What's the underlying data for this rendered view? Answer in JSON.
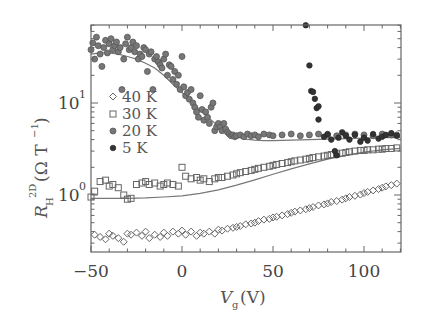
{
  "chart_data": {
    "type": "scatter",
    "title": "",
    "xlabel": "V_g (V)",
    "ylabel": "R_H^2D (Ω T^-1)",
    "xlim": [
      -50,
      120
    ],
    "ylim": [
      0.24,
      70
    ],
    "yscale": "log",
    "grid": false,
    "legend_position": "upper-left inside",
    "x_ticks": [
      -50,
      0,
      50,
      100
    ],
    "x_tick_labels": [
      "−50",
      "0",
      "50",
      "100"
    ],
    "y_ticks": [
      1,
      10
    ],
    "y_tick_labels": [
      "10⁰",
      "10¹"
    ],
    "legend": [
      "40 K",
      "30 K",
      "20 K",
      "5 K"
    ],
    "series": [
      {
        "name": "40 K",
        "marker": "diamond-open",
        "x": [
          -48,
          -45,
          -42,
          -40,
          -38,
          -35,
          -32,
          -30,
          -28,
          -25,
          -22,
          -20,
          -18,
          -15,
          -12,
          -10,
          -8,
          -5,
          -2,
          0,
          2,
          5,
          8,
          10,
          12,
          15,
          18,
          20,
          22,
          25,
          28,
          30,
          32,
          35,
          38,
          40,
          42,
          45,
          48,
          50,
          52,
          55,
          58,
          60,
          62,
          65,
          68,
          70,
          72,
          75,
          78,
          80,
          82,
          85,
          88,
          90,
          92,
          95,
          98,
          100,
          102,
          105,
          108,
          110,
          112,
          115,
          118
        ],
        "y": [
          0.37,
          0.35,
          0.33,
          0.38,
          0.36,
          0.34,
          0.31,
          0.38,
          0.37,
          0.39,
          0.36,
          0.4,
          0.34,
          0.37,
          0.35,
          0.39,
          0.36,
          0.4,
          0.38,
          0.41,
          0.37,
          0.4,
          0.36,
          0.39,
          0.38,
          0.4,
          0.38,
          0.42,
          0.41,
          0.43,
          0.44,
          0.45,
          0.46,
          0.48,
          0.49,
          0.5,
          0.52,
          0.54,
          0.55,
          0.57,
          0.58,
          0.6,
          0.62,
          0.64,
          0.66,
          0.68,
          0.7,
          0.72,
          0.74,
          0.77,
          0.79,
          0.81,
          0.84,
          0.86,
          0.89,
          0.92,
          0.95,
          0.98,
          1.01,
          1.05,
          1.08,
          1.12,
          1.16,
          1.2,
          1.24,
          1.28,
          1.33
        ]
      },
      {
        "name": "30 K",
        "marker": "square-open",
        "x": [
          -50,
          -48,
          -45,
          -42,
          -40,
          -38,
          -35,
          -32,
          -30,
          -28,
          -25,
          -22,
          -20,
          -18,
          -15,
          -12,
          -10,
          -8,
          -5,
          -2,
          0,
          2,
          5,
          8,
          10,
          12,
          15,
          18,
          20,
          22,
          25,
          28,
          30,
          32,
          35,
          38,
          40,
          42,
          45,
          48,
          50,
          52,
          55,
          58,
          60,
          62,
          65,
          68,
          70,
          72,
          75,
          78,
          80,
          82,
          85,
          88,
          90,
          92,
          95,
          98,
          100,
          102,
          105,
          108,
          110,
          112,
          115,
          118
        ],
        "y": [
          0.95,
          1.1,
          1.4,
          1.45,
          1.25,
          1.3,
          1.2,
          1.0,
          0.9,
          0.92,
          1.3,
          1.35,
          1.4,
          1.3,
          1.35,
          1.25,
          1.3,
          1.35,
          1.3,
          1.25,
          2.0,
          1.6,
          1.5,
          1.55,
          1.45,
          1.5,
          1.4,
          1.5,
          1.55,
          1.55,
          1.6,
          1.65,
          1.7,
          1.75,
          1.8,
          1.85,
          1.9,
          1.95,
          2.0,
          2.05,
          2.1,
          2.15,
          2.2,
          2.25,
          2.3,
          2.35,
          2.4,
          2.45,
          2.5,
          2.55,
          2.6,
          2.65,
          2.7,
          2.75,
          2.8,
          2.85,
          2.9,
          2.95,
          3.0,
          3.05,
          3.05,
          3.1,
          3.1,
          3.15,
          3.15,
          3.2,
          3.2,
          3.25
        ]
      },
      {
        "name": "20 K",
        "marker": "circle-dot",
        "x": [
          -50,
          -49,
          -48,
          -47,
          -46,
          -45,
          -44,
          -43,
          -42,
          -41,
          -40,
          -39,
          -38,
          -37,
          -36,
          -35,
          -34,
          -33,
          -32,
          -31,
          -30,
          -29,
          -28,
          -27,
          -26,
          -25,
          -24,
          -23,
          -22,
          -21,
          -20,
          -19,
          -18,
          -17,
          -16,
          -15,
          -14,
          -13,
          -12,
          -11,
          -10,
          -9,
          -8,
          -7,
          -6,
          -5,
          -4,
          -3,
          -2,
          -1,
          0,
          1,
          2,
          3,
          4,
          5,
          6,
          7,
          8,
          9,
          10,
          11,
          12,
          13,
          14,
          15,
          16,
          17,
          18,
          19,
          20,
          21,
          22,
          23,
          24,
          25,
          26,
          27,
          28,
          29,
          30,
          32,
          34,
          36,
          38,
          40,
          42,
          45,
          48,
          50,
          55,
          60,
          65,
          70,
          75,
          80,
          85,
          90,
          95,
          100,
          105,
          110,
          115,
          118
        ],
        "y": [
          38,
          45,
          30,
          52,
          42,
          34,
          25,
          40,
          48,
          35,
          44,
          50,
          38,
          42,
          46,
          36,
          40,
          14,
          30,
          44,
          52,
          38,
          40,
          46,
          36,
          42,
          30,
          34,
          32,
          40,
          38,
          22,
          34,
          36,
          14,
          30,
          32,
          28,
          26,
          24,
          30,
          34,
          20,
          26,
          25,
          18,
          22,
          16,
          20,
          14,
          32,
          15,
          12,
          13,
          11,
          14,
          10,
          9,
          8,
          7,
          12,
          8.5,
          6.5,
          8,
          7,
          6,
          9,
          10,
          5,
          5.5,
          6,
          5.5,
          5,
          6,
          5.2,
          4.8,
          4.6,
          4.4,
          4.5,
          4.3,
          4.4,
          4.5,
          4.3,
          4.6,
          4.4,
          4.5,
          4.3,
          4.6,
          4.5,
          4.4,
          4.5,
          4.6,
          4.4,
          4.5,
          4.6,
          4.5,
          4.4,
          4.5,
          4.6,
          4.5,
          4.4,
          4.6,
          4.5,
          4.5
        ]
      },
      {
        "name": "5 K",
        "marker": "circle-filled",
        "x": [
          68,
          70,
          71,
          72,
          73,
          74,
          75,
          75,
          78,
          80,
          82,
          84,
          85,
          86,
          88,
          90,
          92,
          95,
          98,
          100,
          102,
          105,
          108,
          110,
          112,
          115,
          118
        ],
        "y": [
          70,
          25.6,
          13.5,
          13.2,
          11.1,
          8.8,
          9.2,
          6.6,
          4.3,
          4.6,
          4.0,
          3.0,
          2.7,
          4.2,
          4.8,
          4.4,
          4.0,
          4.5,
          3.8,
          4.2,
          3.9,
          4.6,
          4.1,
          4.3,
          4.5,
          4.7,
          4.4
        ]
      }
    ],
    "fit_curves": [
      {
        "name": "fit-20K",
        "x": [
          -50,
          -45,
          -40,
          -35,
          -30,
          -25,
          -20,
          -15,
          -10,
          -5,
          0,
          5,
          10,
          15,
          20,
          25,
          30,
          35,
          40,
          45,
          50,
          60,
          70,
          80,
          90,
          100,
          110,
          120
        ],
        "y": [
          34,
          35,
          35,
          34,
          32,
          30,
          27,
          24,
          20,
          16,
          13,
          10.5,
          8.3,
          6.8,
          5.6,
          4.8,
          4.3,
          4.05,
          3.95,
          3.9,
          3.9,
          3.95,
          4.0,
          4.05,
          4.1,
          4.15,
          4.2,
          4.2
        ]
      },
      {
        "name": "fit-30K",
        "x": [
          -50,
          -40,
          -30,
          -20,
          -10,
          0,
          10,
          20,
          30,
          40,
          50,
          60,
          70,
          80,
          90,
          100,
          110,
          120
        ],
        "y": [
          0.92,
          0.92,
          0.92,
          0.93,
          0.95,
          0.98,
          1.04,
          1.14,
          1.28,
          1.46,
          1.68,
          1.92,
          2.18,
          2.45,
          2.7,
          2.92,
          3.1,
          3.22
        ]
      }
    ]
  },
  "legend": {
    "items": [
      {
        "label": "40 K",
        "marker": "diamond-open"
      },
      {
        "label": "30 K",
        "marker": "square-open"
      },
      {
        "label": "20 K",
        "marker": "circle-dot"
      },
      {
        "label": "5 K",
        "marker": "circle-filled"
      }
    ]
  },
  "axes": {
    "x_label_main": "V",
    "x_label_sub": "g",
    "x_label_unit": "(V)",
    "y_label_main": "R",
    "y_label_sub": "H",
    "y_label_sup": "2D",
    "y_label_unit": "(Ω T",
    "y_label_unit_sup": "−1",
    "y_label_close": ")",
    "y_tick_10_base": "10",
    "y_tick_10_exp": "1",
    "y_tick_1_base": "10",
    "y_tick_1_exp": "0"
  }
}
